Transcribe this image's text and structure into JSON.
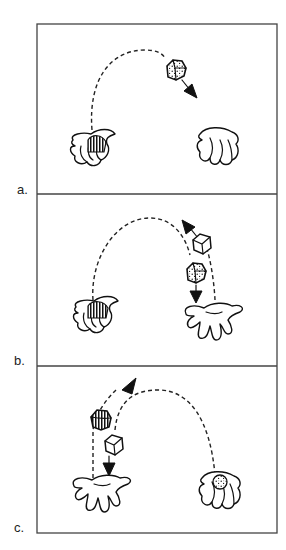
{
  "figure": {
    "panels": [
      {
        "id": "a",
        "label": "a.",
        "description": "Striped ball held in left hand; speckled ball thrown in an arc toward the empty right hand."
      },
      {
        "id": "b",
        "label": "b.",
        "description": "Speckled ball falls to open right hand while the plain ball is thrown upward from it."
      },
      {
        "id": "c",
        "label": "c.",
        "description": "Plain ball falls to open left hand while striped ball is thrown upward; speckled ball rests in right hand."
      }
    ]
  }
}
